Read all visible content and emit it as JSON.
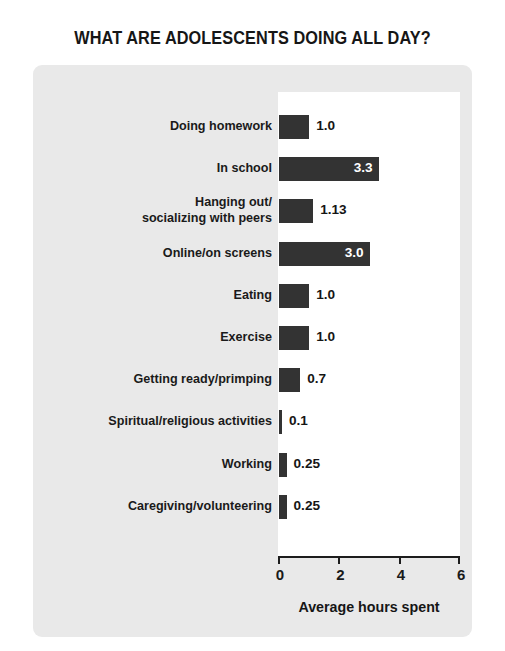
{
  "chart_data": {
    "type": "bar",
    "orientation": "horizontal",
    "title": "WHAT ARE ADOLESCENTS DOING ALL DAY?",
    "xlabel": "Average hours spent",
    "ylabel": "",
    "xlim": [
      0,
      6
    ],
    "xticks": [
      0,
      2,
      4,
      6
    ],
    "xtick_labels": [
      "0",
      "2",
      "4",
      "6"
    ],
    "grid": false,
    "legend": false,
    "categories": [
      "Doing homework",
      "In school",
      "Hanging out/\nsocializing with peers",
      "Online/on screens",
      "Eating",
      "Exercise",
      "Getting ready/primping",
      "Spiritual/religious activities",
      "Working",
      "Caregiving/volunteering"
    ],
    "values": [
      1.0,
      3.3,
      1.13,
      3.0,
      1.0,
      1.0,
      0.7,
      0.1,
      0.25,
      0.25
    ],
    "value_labels": [
      "1.0",
      "3.3",
      "1.13",
      "3.0",
      "1.0",
      "1.0",
      "0.7",
      "0.1",
      "0.25",
      "0.25"
    ],
    "bar_color": "#333333",
    "panel_color": "#e9e9e9",
    "plot_bg_color": "#ffffff"
  },
  "rows": [
    {
      "label_line1": "Doing homework",
      "label_line2": "",
      "value": "1.0",
      "inside": false
    },
    {
      "label_line1": "In school",
      "label_line2": "",
      "value": "3.3",
      "inside": true
    },
    {
      "label_line1": "Hanging out/",
      "label_line2": "socializing with peers",
      "value": "1.13",
      "inside": false
    },
    {
      "label_line1": "Online/on screens",
      "label_line2": "",
      "value": "3.0",
      "inside": true
    },
    {
      "label_line1": "Eating",
      "label_line2": "",
      "value": "1.0",
      "inside": false
    },
    {
      "label_line1": "Exercise",
      "label_line2": "",
      "value": "1.0",
      "inside": false
    },
    {
      "label_line1": "Getting ready/primping",
      "label_line2": "",
      "value": "0.7",
      "inside": false
    },
    {
      "label_line1": "Spiritual/religious activities",
      "label_line2": "",
      "value": "0.1",
      "inside": false
    },
    {
      "label_line1": "Working",
      "label_line2": "",
      "value": "0.25",
      "inside": false
    },
    {
      "label_line1": "Caregiving/volunteering",
      "label_line2": "",
      "value": "0.25",
      "inside": false
    }
  ],
  "axis": {
    "title": "Average hours spent",
    "tick_labels": [
      "0",
      "2",
      "4",
      "6"
    ]
  }
}
